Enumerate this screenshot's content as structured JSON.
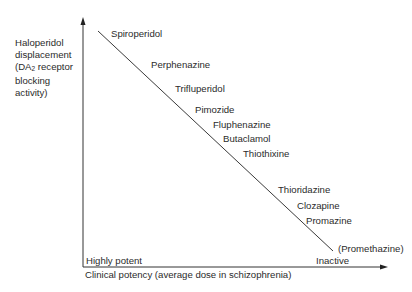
{
  "diagram": {
    "y_axis": {
      "label_lines": [
        "Haloperidol",
        "displacement",
        "(DA",
        "2",
        " receptor",
        "blocking",
        "activity)"
      ],
      "label_full": "Haloperidol displacement (DA2 receptor blocking activity)"
    },
    "x_axis": {
      "label": "Clinical potency (average dose in schizophrenia)",
      "low_end_label": "Highly potent",
      "high_end_label": "Inactive"
    },
    "trend_line": {
      "from": [
        98,
        31
      ],
      "to": [
        333,
        251
      ],
      "description": "Diagonal line: higher DA2 blocking activity corresponds to higher clinical potency"
    },
    "drugs": [
      {
        "name": "Spiroperidol",
        "x": 111,
        "y": 33
      },
      {
        "name": "Perphenazine",
        "x": 151,
        "y": 64
      },
      {
        "name": "Trifluperidol",
        "x": 175,
        "y": 88
      },
      {
        "name": "Pimozide",
        "x": 195,
        "y": 109
      },
      {
        "name": "Fluphenazine",
        "x": 213,
        "y": 124
      },
      {
        "name": "Butaclamol",
        "x": 223,
        "y": 138
      },
      {
        "name": "Thiothixine",
        "x": 243,
        "y": 153
      },
      {
        "name": "Thioridazine",
        "x": 278,
        "y": 189
      },
      {
        "name": "Clozapine",
        "x": 297,
        "y": 205
      },
      {
        "name": "Promazine",
        "x": 306,
        "y": 220
      },
      {
        "name": "(Promethazine)",
        "x": 338,
        "y": 248
      }
    ],
    "colors": {
      "axis": "#333333",
      "line": "#3a3a3a",
      "text": "#2b2b2b",
      "background": "#ffffff"
    }
  }
}
